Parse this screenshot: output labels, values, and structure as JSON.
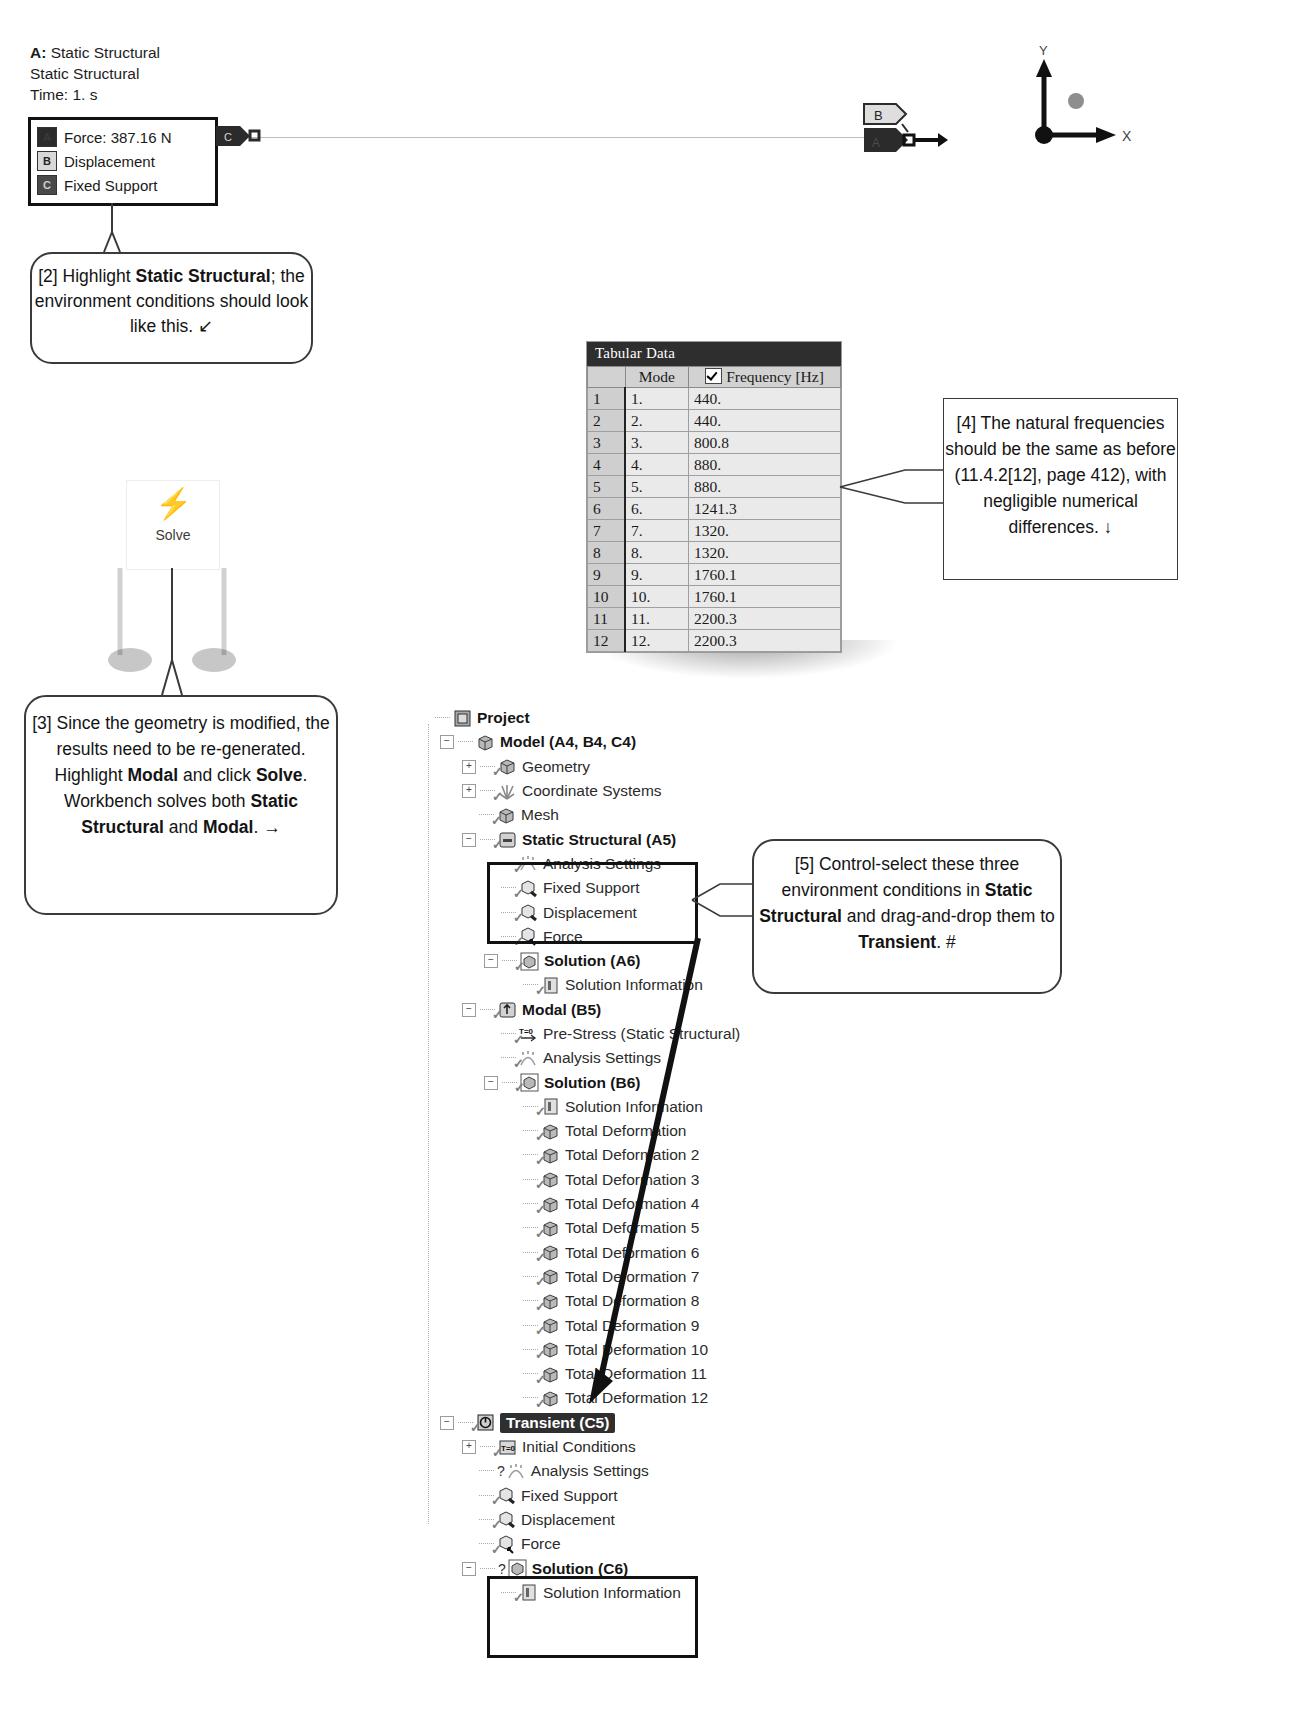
{
  "legend": {
    "title_line1_bold": "A:",
    "title_line1": " Static Structural",
    "title_line2": "Static Structural",
    "title_line3": "Time: 1. s",
    "items": [
      {
        "badge": "A",
        "label": "Force: 387.16 N"
      },
      {
        "badge": "B",
        "label": "Displacement"
      },
      {
        "badge": "C",
        "label": "Fixed Support"
      }
    ]
  },
  "graphics": {
    "tag_c": "C",
    "tag_b": "B",
    "tag_a": "A",
    "axis_y": "Y",
    "axis_x": "X"
  },
  "solve": {
    "icon": "solve-lightning-icon",
    "label": "Solve"
  },
  "callouts": {
    "c2": {
      "parts": [
        {
          "t": "[2] Highlight ",
          "b": false
        },
        {
          "t": "Static Structural",
          "b": true
        },
        {
          "t": "; the environment conditions should look like this.  ↙",
          "b": false
        }
      ]
    },
    "c3": {
      "parts": [
        {
          "t": "[3] Since the geometry is modified, the results need to be re-generated.  Highlight ",
          "b": false
        },
        {
          "t": "Modal",
          "b": true
        },
        {
          "t": " and click ",
          "b": false
        },
        {
          "t": "Solve",
          "b": true
        },
        {
          "t": ".  Workbench solves both ",
          "b": false
        },
        {
          "t": "Static Structural",
          "b": true
        },
        {
          "t": " and ",
          "b": false
        },
        {
          "t": "Modal",
          "b": true
        },
        {
          "t": ". →",
          "b": false
        }
      ]
    },
    "c4": {
      "parts": [
        {
          "t": "[4] The natural frequencies should be the same as before (11.4.2[12], page 412), with negligible numerical differences. ↓",
          "b": false
        }
      ]
    },
    "c5": {
      "parts": [
        {
          "t": "[5] Control-select these three environment conditions in ",
          "b": false
        },
        {
          "t": "Static Structural",
          "b": true
        },
        {
          "t": " and drag-and-drop them to ",
          "b": false
        },
        {
          "t": "Transient",
          "b": true
        },
        {
          "t": ". #",
          "b": false
        }
      ]
    }
  },
  "tabular": {
    "title": "Tabular Data",
    "headers": [
      "",
      "Mode",
      "Frequency [Hz]"
    ],
    "checkbox_checked": true,
    "rows": [
      {
        "idx": "1",
        "mode": "1.",
        "freq": "440."
      },
      {
        "idx": "2",
        "mode": "2.",
        "freq": "440."
      },
      {
        "idx": "3",
        "mode": "3.",
        "freq": "800.8"
      },
      {
        "idx": "4",
        "mode": "4.",
        "freq": "880."
      },
      {
        "idx": "5",
        "mode": "5.",
        "freq": "880."
      },
      {
        "idx": "6",
        "mode": "6.",
        "freq": "1241.3"
      },
      {
        "idx": "7",
        "mode": "7.",
        "freq": "1320."
      },
      {
        "idx": "8",
        "mode": "8.",
        "freq": "1320."
      },
      {
        "idx": "9",
        "mode": "9.",
        "freq": "1760.1"
      },
      {
        "idx": "10",
        "mode": "10.",
        "freq": "1760.1"
      },
      {
        "idx": "11",
        "mode": "11.",
        "freq": "2200.3"
      },
      {
        "idx": "12",
        "mode": "12.",
        "freq": "2200.3"
      }
    ]
  },
  "tree": {
    "nodes": [
      {
        "label": "Project",
        "indent": 0,
        "bold": true,
        "exp": "",
        "icon": "project-icon",
        "check": false
      },
      {
        "label": "Model (A4, B4, C4)",
        "indent": 1,
        "bold": true,
        "exp": "-",
        "icon": "model-icon",
        "check": false
      },
      {
        "label": "Geometry",
        "indent": 2,
        "bold": false,
        "exp": "+",
        "icon": "geometry-icon",
        "check": true
      },
      {
        "label": "Coordinate Systems",
        "indent": 2,
        "bold": false,
        "exp": "+",
        "icon": "coordsys-icon",
        "check": true
      },
      {
        "label": "Mesh",
        "indent": 2,
        "bold": false,
        "exp": "",
        "icon": "mesh-icon",
        "check": true
      },
      {
        "label": "Static Structural (A5)",
        "indent": 2,
        "bold": true,
        "exp": "-",
        "icon": "analysis-icon",
        "check": true
      },
      {
        "label": "Analysis Settings",
        "indent": 3,
        "bold": false,
        "exp": "",
        "icon": "settings-icon",
        "check": true
      },
      {
        "label": "Fixed Support",
        "indent": 3,
        "bold": false,
        "exp": "",
        "icon": "support-icon",
        "check": true
      },
      {
        "label": "Displacement",
        "indent": 3,
        "bold": false,
        "exp": "",
        "icon": "support-icon",
        "check": true
      },
      {
        "label": "Force",
        "indent": 3,
        "bold": false,
        "exp": "",
        "icon": "force-icon",
        "check": true
      },
      {
        "label": "Solution (A6)",
        "indent": 3,
        "bold": true,
        "exp": "-",
        "icon": "solution-icon",
        "check": true
      },
      {
        "label": "Solution Information",
        "indent": 4,
        "bold": false,
        "exp": "",
        "icon": "info-icon",
        "check": true
      },
      {
        "label": "Modal (B5)",
        "indent": 2,
        "bold": true,
        "exp": "-",
        "icon": "modal-icon",
        "check": true
      },
      {
        "label": "Pre-Stress (Static Structural)",
        "indent": 3,
        "bold": false,
        "exp": "",
        "icon": "prestress-icon",
        "check": true
      },
      {
        "label": "Analysis Settings",
        "indent": 3,
        "bold": false,
        "exp": "",
        "icon": "settings-icon",
        "check": true
      },
      {
        "label": "Solution (B6)",
        "indent": 3,
        "bold": true,
        "exp": "-",
        "icon": "solution-icon",
        "check": true
      },
      {
        "label": "Solution Information",
        "indent": 4,
        "bold": false,
        "exp": "",
        "icon": "info-icon",
        "check": true
      },
      {
        "label": "Total Deformation",
        "indent": 4,
        "bold": false,
        "exp": "",
        "icon": "deformation-icon",
        "check": true
      },
      {
        "label": "Total Deformation 2",
        "indent": 4,
        "bold": false,
        "exp": "",
        "icon": "deformation-icon",
        "check": true
      },
      {
        "label": "Total Deformation 3",
        "indent": 4,
        "bold": false,
        "exp": "",
        "icon": "deformation-icon",
        "check": true
      },
      {
        "label": "Total Deformation 4",
        "indent": 4,
        "bold": false,
        "exp": "",
        "icon": "deformation-icon",
        "check": true
      },
      {
        "label": "Total Deformation 5",
        "indent": 4,
        "bold": false,
        "exp": "",
        "icon": "deformation-icon",
        "check": true
      },
      {
        "label": "Total Deformation 6",
        "indent": 4,
        "bold": false,
        "exp": "",
        "icon": "deformation-icon",
        "check": true
      },
      {
        "label": "Total Deformation 7",
        "indent": 4,
        "bold": false,
        "exp": "",
        "icon": "deformation-icon",
        "check": true
      },
      {
        "label": "Total Deformation 8",
        "indent": 4,
        "bold": false,
        "exp": "",
        "icon": "deformation-icon",
        "check": true
      },
      {
        "label": "Total Deformation 9",
        "indent": 4,
        "bold": false,
        "exp": "",
        "icon": "deformation-icon",
        "check": true
      },
      {
        "label": "Total Deformation 10",
        "indent": 4,
        "bold": false,
        "exp": "",
        "icon": "deformation-icon",
        "check": true
      },
      {
        "label": "Total Deformation 11",
        "indent": 4,
        "bold": false,
        "exp": "",
        "icon": "deformation-icon",
        "check": true
      },
      {
        "label": "Total Deformation 12",
        "indent": 4,
        "bold": false,
        "exp": "",
        "icon": "deformation-icon",
        "check": true
      },
      {
        "label": "Transient (C5)",
        "indent": 1,
        "bold": true,
        "exp": "-",
        "icon": "transient-icon",
        "check": true,
        "selected": true
      },
      {
        "label": "Initial Conditions",
        "indent": 2,
        "bold": false,
        "exp": "+",
        "icon": "initcond-icon",
        "check": true
      },
      {
        "label": "Analysis Settings",
        "indent": 2,
        "bold": false,
        "exp": "",
        "icon": "settings-icon",
        "check": false,
        "question": true
      },
      {
        "label": "Fixed Support",
        "indent": 2,
        "bold": false,
        "exp": "",
        "icon": "support-icon",
        "check": true
      },
      {
        "label": "Displacement",
        "indent": 2,
        "bold": false,
        "exp": "",
        "icon": "support-icon",
        "check": true
      },
      {
        "label": "Force",
        "indent": 2,
        "bold": false,
        "exp": "",
        "icon": "force-icon",
        "check": true
      },
      {
        "label": "Solution (C6)",
        "indent": 2,
        "bold": true,
        "exp": "-",
        "icon": "solution-icon",
        "check": false,
        "question": true
      },
      {
        "label": "Solution Information",
        "indent": 3,
        "bold": false,
        "exp": "",
        "icon": "info-icon",
        "check": true
      }
    ]
  }
}
